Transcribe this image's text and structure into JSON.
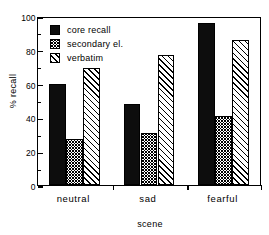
{
  "chart_data": {
    "type": "bar",
    "title": "",
    "xlabel": "scene",
    "ylabel": "% recall",
    "categories": [
      "neutral",
      "sad",
      "fearful"
    ],
    "series": [
      {
        "name": "core recall",
        "values": [
          60,
          48,
          96
        ]
      },
      {
        "name": "secondary el.",
        "values": [
          27,
          31,
          41
        ]
      },
      {
        "name": "verbatim",
        "values": [
          69,
          77,
          86
        ]
      }
    ],
    "ylim": [
      0,
      100
    ],
    "ytick_labels": [
      "0",
      "20",
      "40",
      "60",
      "80",
      "100"
    ],
    "ytick_values": [
      0,
      20,
      40,
      60,
      80,
      100
    ],
    "yminor_values": [
      10,
      30,
      50,
      70,
      90
    ],
    "grid": false,
    "legend_position": "top-left",
    "frame": "box"
  },
  "legend": {
    "items": [
      {
        "label": "core recall",
        "swatch": "solid-black-swatch"
      },
      {
        "label": "secondary el.",
        "swatch": "crosshatch-swatch"
      },
      {
        "label": "verbatim",
        "swatch": "diagonal-hatch-swatch"
      }
    ]
  },
  "axes": {
    "y_title": "% recall",
    "x_title": "scene"
  }
}
